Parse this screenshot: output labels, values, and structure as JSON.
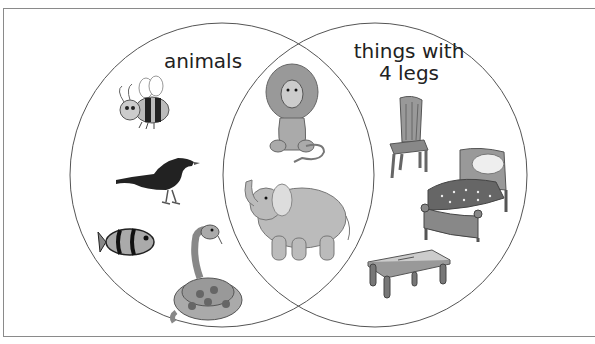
{
  "diagram": {
    "type": "venn",
    "sets": [
      {
        "id": "left",
        "label": "animals"
      },
      {
        "id": "right",
        "label": "things with 4 legs"
      }
    ],
    "label_lines": {
      "left": [
        "animals"
      ],
      "right": [
        "things with",
        "4 legs"
      ]
    },
    "regions": {
      "left_only": [
        "bee",
        "bird",
        "clownfish",
        "snake"
      ],
      "intersection": [
        "lion",
        "elephant"
      ],
      "right_only": [
        "chair",
        "bed",
        "table"
      ]
    }
  },
  "colors": {
    "circle_stroke": "#555555",
    "frame_border": "#8a8a8a",
    "text": "#222222"
  }
}
